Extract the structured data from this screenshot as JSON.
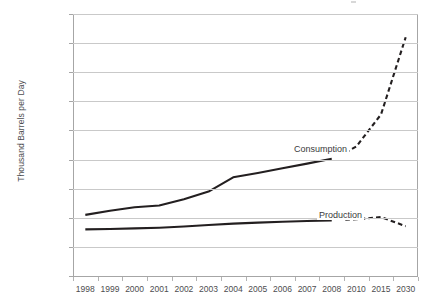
{
  "chart_data": {
    "type": "line",
    "title": "",
    "xlabel": "",
    "ylabel": "Thousand Barrels per Day",
    "ylim": [
      0,
      18000
    ],
    "ytick_labels": [
      "18,000",
      "16,000",
      "14,000",
      "12,000",
      "10,000",
      "8,000",
      "6,000",
      "4,000",
      "2,000",
      "0"
    ],
    "ytick_values": [
      18000,
      16000,
      14000,
      12000,
      10000,
      8000,
      6000,
      4000,
      2000,
      0
    ],
    "grid": true,
    "legend": "inline-labels",
    "categories": [
      "1998",
      "1999",
      "2000",
      "2001",
      "2002",
      "2003",
      "2004",
      "2005",
      "2006",
      "2007",
      "2008",
      "2010",
      "2015",
      "2030"
    ],
    "series": [
      {
        "name": "Consumption",
        "historical_categories": [
          "1998",
          "1999",
          "2000",
          "2001",
          "2002",
          "2003",
          "2004",
          "2005",
          "2006",
          "2007",
          "2008"
        ],
        "historical_values": [
          4200,
          4480,
          4720,
          4840,
          5280,
          5800,
          6780,
          7080,
          7400,
          7720,
          8050
        ],
        "forecast_categories": [
          "2010",
          "2015",
          "2030"
        ],
        "forecast_values": [
          8900,
          11100,
          16400
        ],
        "style_historical": "solid",
        "style_forecast": "dashed"
      },
      {
        "name": "Production",
        "historical_categories": [
          "1998",
          "1999",
          "2000",
          "2001",
          "2002",
          "2003",
          "2004",
          "2005",
          "2006",
          "2007",
          "2008"
        ],
        "historical_values": [
          3200,
          3230,
          3270,
          3320,
          3400,
          3500,
          3600,
          3670,
          3730,
          3780,
          3820
        ],
        "forecast_categories": [
          "2010",
          "2015",
          "2030"
        ],
        "forecast_values": [
          3900,
          4050,
          3420
        ],
        "style_historical": "solid",
        "style_forecast": "dashed"
      }
    ],
    "annotations": [
      {
        "text": "Consumption",
        "near_series": "Consumption"
      },
      {
        "text": "Production",
        "near_series": "Production"
      }
    ],
    "colors": {
      "series_line": "#231f20",
      "gridline": "#c9c9c9",
      "axis": "#a6a6a6",
      "text": "#4d4d4f",
      "background": "#ffffff"
    }
  },
  "axis": {
    "y": {
      "title": "Thousand Barrels per Day",
      "ticks": [
        {
          "label": "18,000"
        },
        {
          "label": "16,000"
        },
        {
          "label": "14,000"
        },
        {
          "label": "12,000"
        },
        {
          "label": "10,000"
        },
        {
          "label": "8,000"
        },
        {
          "label": "6,000"
        },
        {
          "label": "4,000"
        },
        {
          "label": "2,000"
        },
        {
          "label": "0"
        }
      ]
    },
    "x": {
      "ticks": [
        {
          "label": "1998"
        },
        {
          "label": "1999"
        },
        {
          "label": "2000"
        },
        {
          "label": "2001"
        },
        {
          "label": "2002"
        },
        {
          "label": "2003"
        },
        {
          "label": "2004"
        },
        {
          "label": "2005"
        },
        {
          "label": "2006"
        },
        {
          "label": "2007"
        },
        {
          "label": "2008"
        },
        {
          "label": "2010"
        },
        {
          "label": "2015"
        },
        {
          "label": "2030"
        }
      ]
    }
  },
  "labels": {
    "consumption": "Consumption",
    "production": "Production"
  }
}
